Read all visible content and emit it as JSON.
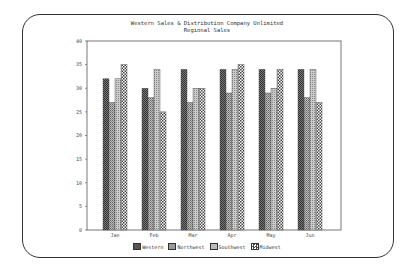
{
  "chart_data": {
    "type": "bar",
    "title": "Western Sales & Distribution Company Unlimited",
    "subtitle": "Regional Sales",
    "xlabel": "",
    "ylabel": "",
    "ylim": [
      0,
      40
    ],
    "yticks": [
      0,
      5,
      10,
      15,
      20,
      25,
      30,
      35,
      40
    ],
    "grid": false,
    "legend_position": "bottom",
    "categories": [
      "Jan",
      "Feb",
      "Mar",
      "Apr",
      "May",
      "Jun"
    ],
    "series": [
      {
        "name": "Western",
        "values": [
          32,
          30,
          34,
          34,
          34,
          34
        ]
      },
      {
        "name": "Northwest",
        "values": [
          27,
          28,
          27,
          29,
          29,
          28
        ]
      },
      {
        "name": "Southwest",
        "values": [
          32,
          34,
          30,
          34,
          30,
          34
        ]
      },
      {
        "name": "Midwest",
        "values": [
          35,
          25,
          30,
          35,
          34,
          27
        ]
      }
    ]
  },
  "legend": {
    "items": [
      {
        "label": "Western"
      },
      {
        "label": "Northwest"
      },
      {
        "label": "Southwest"
      },
      {
        "label": "Midwest"
      }
    ]
  }
}
